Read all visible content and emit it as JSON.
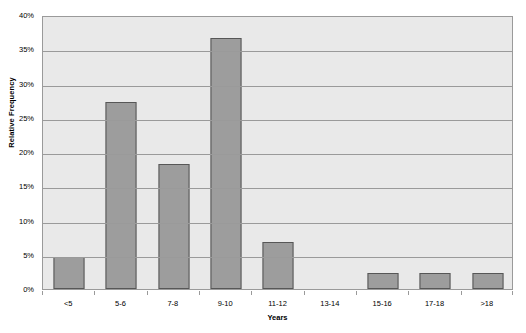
{
  "chart_data": {
    "type": "bar",
    "title": "",
    "xlabel": "Years",
    "ylabel": "Relative Frequency",
    "categories": [
      "<5",
      "5-6",
      "7-8",
      "9-10",
      "11-12",
      "13-14",
      "15-16",
      "17-18",
      ">18"
    ],
    "values": [
      4.7,
      27.3,
      18.3,
      36.6,
      6.9,
      0,
      2.3,
      2.3,
      2.3
    ],
    "value_labels": [
      "4.7%",
      "27.3%",
      "18.3%",
      "36.6%",
      "6.9%",
      "0%",
      "2.3%",
      "2.3%",
      "2.3%"
    ],
    "ylim": [
      0,
      40
    ],
    "ytick_values": [
      0,
      5,
      10,
      15,
      20,
      25,
      30,
      35,
      40
    ],
    "ytick_labels": [
      "0%",
      "5%",
      "10%",
      "15%",
      "20%",
      "25%",
      "30%",
      "35%",
      "40%"
    ],
    "grid": true,
    "legend": false,
    "series": [
      {
        "name": "Relative Frequency",
        "values": [
          4.7,
          27.3,
          18.3,
          36.6,
          6.9,
          0,
          2.3,
          2.3,
          2.3
        ]
      }
    ],
    "colors": {
      "bar_fill": "#9d9d9d",
      "bar_border": "#575757",
      "plot_background": "#e9e9e9",
      "gridline": "#9a9a9a",
      "page_background": "#ffffff",
      "text": "#000000"
    }
  }
}
